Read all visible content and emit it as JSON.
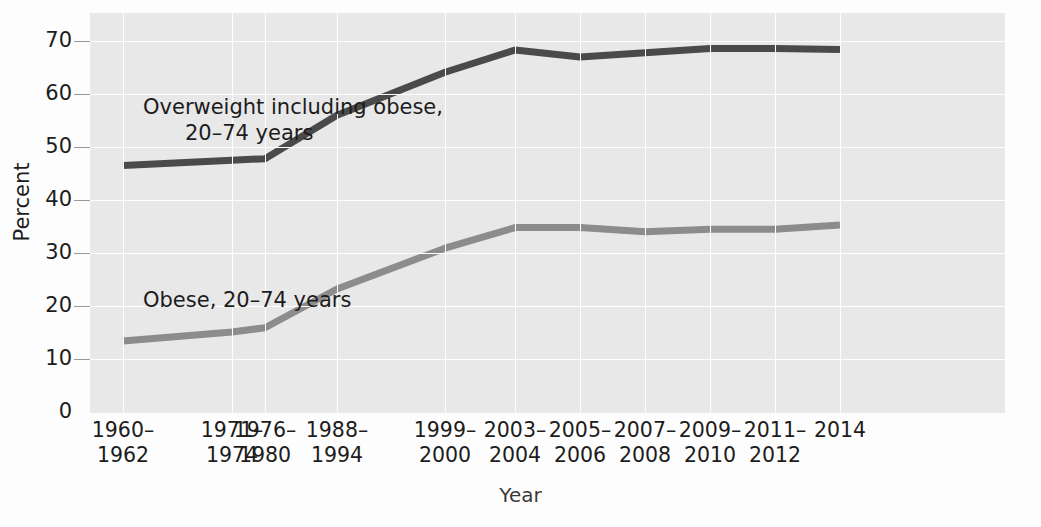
{
  "axis": {
    "y_title": "Percent",
    "x_title": "Year",
    "y_ticks": [
      70,
      60,
      50,
      40,
      30,
      20,
      10,
      0
    ]
  },
  "annotations": {
    "overweight_line1": "Overweight including obese,",
    "overweight_line2": "20–74 years",
    "obese": "Obese, 20–74 years"
  },
  "x_labels": [
    {
      "l1": "1960–",
      "l2": "1962"
    },
    {
      "l1": "1971–",
      "l2": "1974"
    },
    {
      "l1": "1976–",
      "l2": "1980"
    },
    {
      "l1": "1988–",
      "l2": "1994"
    },
    {
      "l1": "1999–",
      "l2": "2000"
    },
    {
      "l1": "2003–",
      "l2": "2004"
    },
    {
      "l1": "2005–",
      "l2": "2006"
    },
    {
      "l1": "2007–",
      "l2": "2008"
    },
    {
      "l1": "2009–",
      "l2": "2010"
    },
    {
      "l1": "2011–",
      "l2": "2012"
    },
    {
      "l1": "2014",
      "l2": ""
    }
  ],
  "colors": {
    "overweight_line": "#4a4a4a",
    "obese_line": "#8c8c8c",
    "panel_background": "#e8e8e8",
    "grid": "#ffffff",
    "text": "#1c1c1c"
  },
  "chart_data": {
    "type": "line",
    "title": "",
    "xlabel": "Year",
    "ylabel": "Percent",
    "ylim": [
      0,
      73
    ],
    "grid": true,
    "legend": "inline-annotations",
    "categories": [
      "1960–1962",
      "1971–1974",
      "1976–1980",
      "1988–1994",
      "1999–2000",
      "2003–2004",
      "2005–2006",
      "2007–2008",
      "2009–2010",
      "2011–2012",
      "2014"
    ],
    "series": [
      {
        "name": "Overweight including obese, 20–74 years",
        "color": "#4a4a4a",
        "values": [
          46.5,
          47.5,
          47.8,
          56.0,
          64.1,
          68.3,
          67.0,
          67.8,
          68.6,
          68.6,
          68.4
        ]
      },
      {
        "name": "Obese, 20–74 years",
        "color": "#8c8c8c",
        "values": [
          13.4,
          15.1,
          15.9,
          23.2,
          30.9,
          34.8,
          34.8,
          34.0,
          34.5,
          34.5,
          35.3
        ]
      }
    ]
  }
}
